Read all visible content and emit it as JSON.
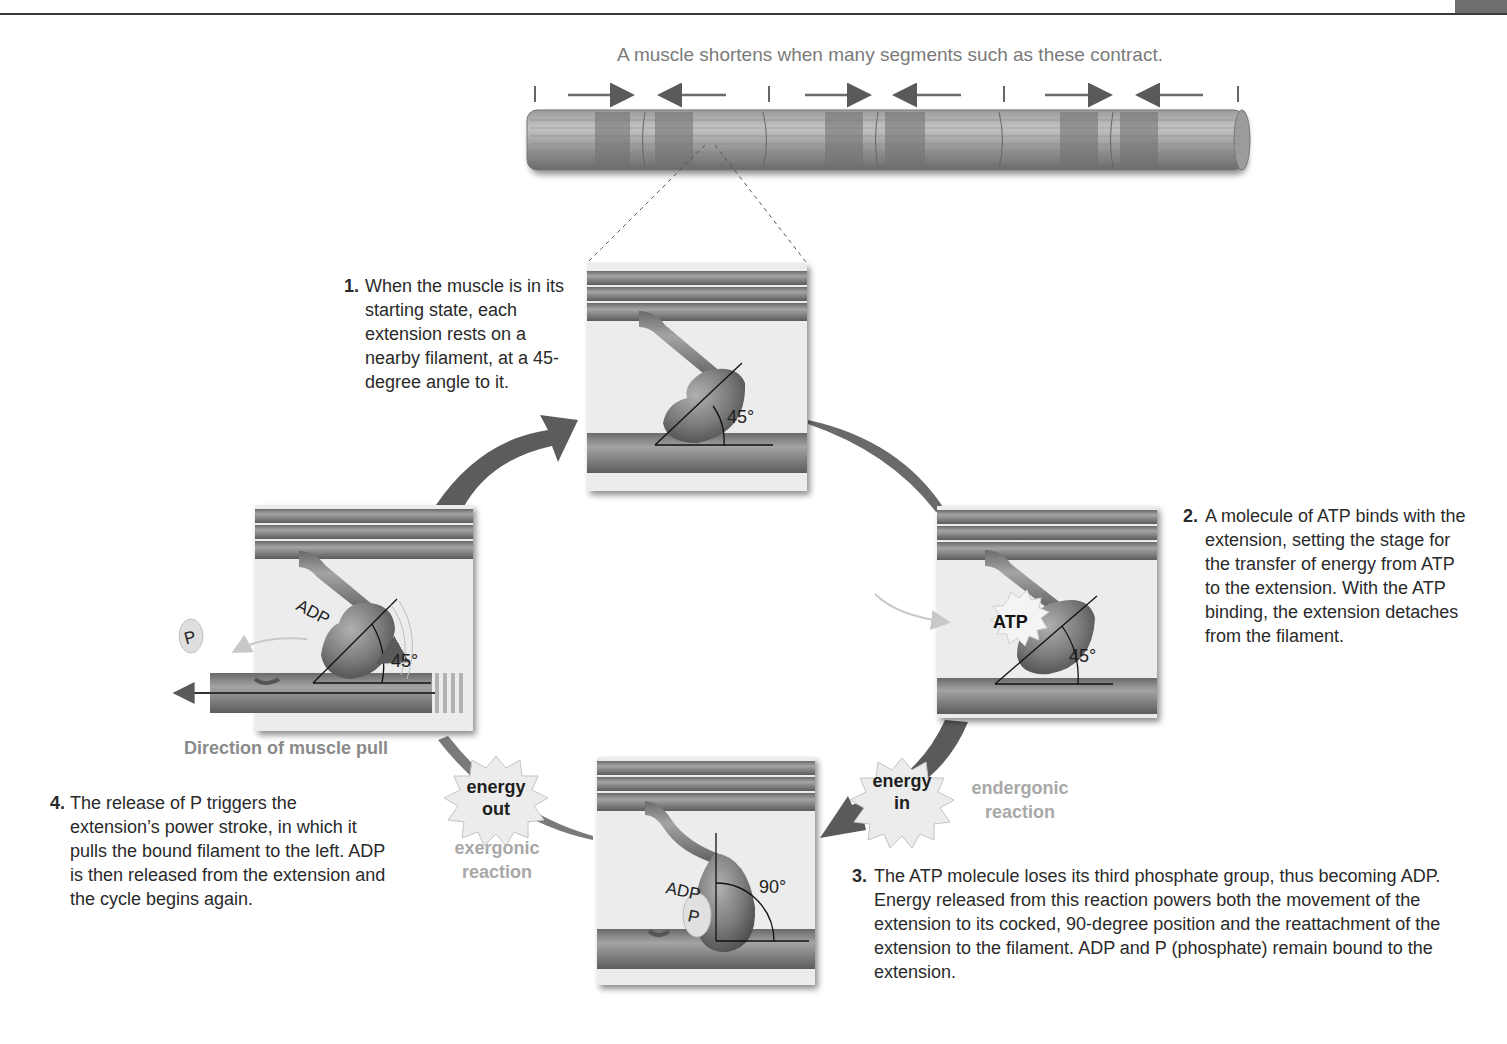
{
  "figure": {
    "caption": "A muscle shortens when many segments such as these contract.",
    "steps": [
      {
        "number": "1.",
        "text": "When the muscle is in its starting state, each extension rests on a nearby filament, at a 45-degree angle to it."
      },
      {
        "number": "2.",
        "text": "A molecule of ATP binds with the extension, setting the stage for the transfer of energy from ATP to the extension. With the ATP binding, the extension detaches from the filament."
      },
      {
        "number": "3.",
        "text": "The ATP molecule loses its third phosphate group, thus becoming ADP. Energy released from this reaction powers both the movement of the extension to its cocked, 90-degree position and the reattachment of the extension to the filament. ADP and P (phosphate) remain bound to the extension."
      },
      {
        "number": "4.",
        "text": "The release of P triggers the extension’s power stroke, in which it pulls the bound filament to the left. ADP is then released from the extension and the cycle begins again."
      }
    ],
    "panels": {
      "panel1": {
        "angle": "45°"
      },
      "panel2": {
        "angle": "45°",
        "molecule": "ATP"
      },
      "panel3": {
        "angle": "90°",
        "molecule": "ADP",
        "phosphate": "P"
      },
      "panel4": {
        "angle": "45°",
        "molecule": "ADP",
        "released": "P"
      }
    },
    "energy_in": {
      "burst_line1": "energy",
      "burst_line2": "in",
      "label_line1": "endergonic",
      "label_line2": "reaction"
    },
    "energy_out": {
      "burst_line1": "energy",
      "burst_line2": "out",
      "label_line1": "exergonic",
      "label_line2": "reaction"
    },
    "pull_label": "Direction of muscle pull",
    "colors": {
      "filament": "#7d7d7d",
      "filament_dark": "#5a5a5a",
      "panel_bg": "#ececec",
      "arrow": "#5e5e5e",
      "grey_text": "#a8a8a8"
    }
  }
}
